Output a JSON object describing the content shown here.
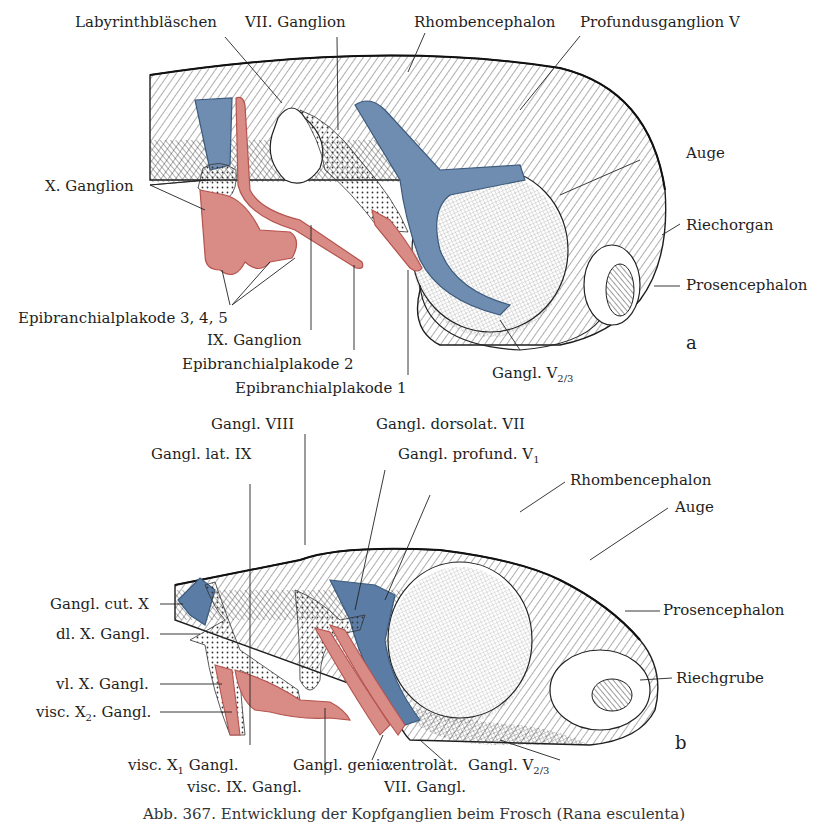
{
  "figure": {
    "caption": "Abb. 367. Entwicklung der Kopfganglien beim Frosch (Rana esculenta)",
    "colors": {
      "placode_red": "#d98b86",
      "placode_red_edge": "#b5534e",
      "ganglion_blue": "#6f8db0",
      "ganglion_blue_edge": "#3c5a7c",
      "hatch": "#2a2a2a",
      "background": "#ffffff"
    },
    "panel_a": {
      "letter": "a",
      "labels": {
        "labyrinthblaschen": "Labyrinthbläschen",
        "vii_ganglion": "VII. Ganglion",
        "rhombencephalon": "Rhombencephalon",
        "profundusganglion": "Profundusganglion V",
        "auge": "Auge",
        "x_ganglion": "X. Ganglion",
        "riechorgan": "Riechorgan",
        "prosencephalon": "Prosencephalon",
        "epibranchial_345": "Epibranchialplakode 3, 4, 5",
        "ix_ganglion": "IX. Ganglion",
        "epibranchial_2": "Epibranchialplakode 2",
        "epibranchial_1": "Epibranchialplakode 1",
        "gangl_v23_main": "Gangl. V",
        "gangl_v23_sub": "2/3"
      }
    },
    "panel_b": {
      "letter": "b",
      "labels": {
        "gangl_viii": "Gangl. VIII",
        "gangl_dorsolat_vii": "Gangl. dorsolat. VII",
        "gangl_lat_ix": "Gangl. lat. IX",
        "gangl_profund_main": "Gangl. profund. V",
        "gangl_profund_sub": "1",
        "rhombencephalon": "Rhombencephalon",
        "auge": "Auge",
        "gangl_cut_x": "Gangl. cut. X",
        "prosencephalon": "Prosencephalon",
        "dl_x_gangl": "dl. X. Gangl.",
        "riechgrube": "Riechgrube",
        "vl_x_gangl": "vl. X. Gangl.",
        "visc_x2_pre": "visc. X",
        "visc_x2_sub": "2",
        "visc_x2_post": ". Gangl.",
        "visc_x1_pre": "visc. X",
        "visc_x1_sub": "1",
        "visc_x1_post": " Gangl.",
        "visc_ix_gangl": "visc. IX. Gangl.",
        "gangl_genic": "Gangl. genic.",
        "ventrolat_line1": "ventrolat.",
        "ventrolat_line2": "VII. Gangl.",
        "gangl_v23_main": "Gangl. V",
        "gangl_v23_sub": "2/3"
      }
    }
  }
}
